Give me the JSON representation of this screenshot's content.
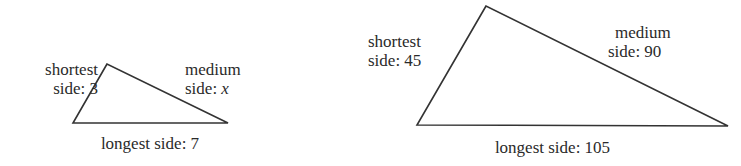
{
  "stroke_color": "#333333",
  "triangles": [
    {
      "id": "small",
      "vertices": {
        "top": [
          107,
          64
        ],
        "bottom_left": [
          73,
          123
        ],
        "bottom_right": [
          228,
          123
        ]
      },
      "shortest": {
        "line1": "shortest",
        "line2_prefix": "side: ",
        "line2_value": "3"
      },
      "medium": {
        "line1": "medium",
        "line2_prefix": "side: ",
        "line2_value": "x"
      },
      "longest": {
        "prefix": "longest side: ",
        "value": "7"
      }
    },
    {
      "id": "large",
      "vertices": {
        "top": [
          486,
          6
        ],
        "bottom_left": [
          417,
          125
        ],
        "bottom_right": [
          728,
          126
        ]
      },
      "shortest": {
        "line1": "shortest",
        "line2_prefix": "side: ",
        "line2_value": "45"
      },
      "medium": {
        "line1": "medium",
        "line2_prefix": "side: ",
        "line2_value": "90"
      },
      "longest": {
        "prefix": "longest side: ",
        "value": "105"
      }
    }
  ]
}
